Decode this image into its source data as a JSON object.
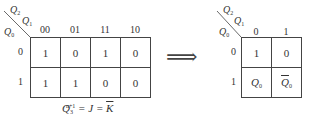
{
  "left_map": {
    "var_top": "Q",
    "var_top_sub": "2",
    "var_mid": "Q",
    "var_mid_sub": "1",
    "var_row": "Q",
    "var_row_sub": "0",
    "columns": [
      "00",
      "01",
      "11",
      "10"
    ],
    "rows": [
      "0",
      "1"
    ],
    "cells": [
      [
        "1",
        "0",
        "1",
        "0"
      ],
      [
        "1",
        "1",
        "0",
        "0"
      ]
    ],
    "equation": {
      "lhs": "Q",
      "lhs_sub": "3",
      "lhs_sup": "n+1",
      "mid": " = J = ",
      "rhs": "K"
    }
  },
  "arrow": "⟹",
  "right_map": {
    "var_top": "Q",
    "var_top_sub": "2",
    "var_mid": "Q",
    "var_mid_sub": "1",
    "var_row": "Q",
    "var_row_sub": "0",
    "columns": [
      "0",
      "1"
    ],
    "rows": [
      "0",
      "1"
    ],
    "cells": [
      [
        {
          "text": "1",
          "sub": "",
          "bar": false
        },
        {
          "text": "0",
          "sub": "",
          "bar": false
        }
      ],
      [
        {
          "text": "Q",
          "sub": "0",
          "bar": false
        },
        {
          "text": "Q",
          "sub": "0",
          "bar": true
        }
      ]
    ]
  }
}
